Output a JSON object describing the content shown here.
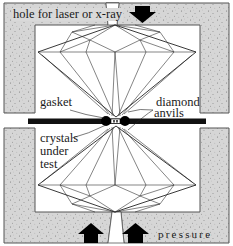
{
  "diagram": {
    "labels": {
      "hole": "hole for laser or x-ray",
      "gasket": "gasket",
      "diamond_line1": "diamond",
      "diamond_line2": "anvils",
      "crystals_line1": "crystals",
      "crystals_line2": "under",
      "crystals_line3": "test",
      "pressure": "pressure"
    },
    "colors": {
      "housing_fill": "#d6d6d6",
      "housing_stroke": "#555555",
      "gasket": "#111111",
      "arrow": "#000000",
      "background": "#ffffff",
      "facet_lines": "#333333"
    },
    "arrows": [
      {
        "direction": "down",
        "position": "top-right"
      },
      {
        "direction": "up",
        "position": "bottom-left"
      },
      {
        "direction": "up",
        "position": "bottom-right"
      }
    ]
  }
}
